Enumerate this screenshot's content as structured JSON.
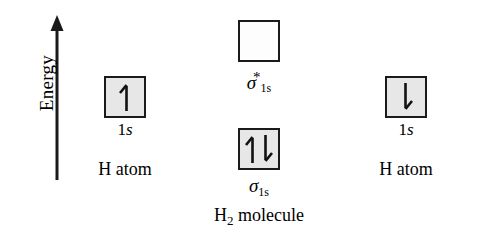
{
  "diagram": {
    "background_color": "#ffffff",
    "line_color": "#1a1a1a",
    "filled_box_color": "#e7e7e7",
    "empty_box_color": "#fdfdfd"
  },
  "axis": {
    "label": "Energy",
    "direction": "up",
    "icon": "up-arrow-icon"
  },
  "left_atom": {
    "orbital_label_n": "1",
    "orbital_label_l": "s",
    "species_label": "H atom",
    "electrons": 1,
    "spins": [
      "up"
    ],
    "box_fill": "#e7e7e7"
  },
  "right_atom": {
    "orbital_label_n": "1",
    "orbital_label_l": "s",
    "species_label": "H atom",
    "electrons": 1,
    "spins": [
      "down"
    ],
    "box_fill": "#e7e7e7"
  },
  "antibonding": {
    "sigma": "σ",
    "star": "*",
    "sub_n": "1",
    "sub_l": "s",
    "electrons": 0,
    "spins": [],
    "box_fill": "#fdfdfd"
  },
  "bonding": {
    "sigma": "σ",
    "sub_n": "1",
    "sub_l": "s",
    "electrons": 2,
    "spins": [
      "up",
      "down"
    ],
    "box_fill": "#e7e7e7"
  },
  "molecule": {
    "formula_head": "H",
    "formula_sub": "2",
    "formula_tail": " molecule"
  }
}
